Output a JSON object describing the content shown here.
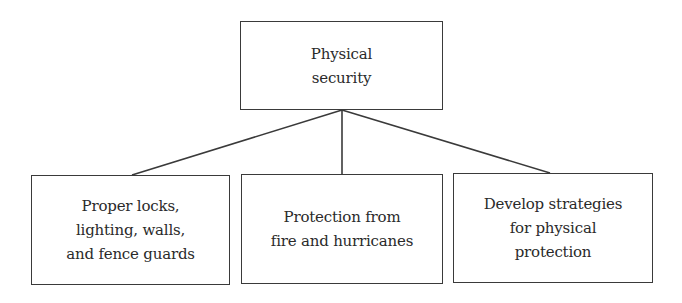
{
  "diagram": {
    "type": "hierarchy",
    "root": {
      "label": "Physical\nsecurity"
    },
    "children": [
      {
        "label": "Proper locks,\nlighting, walls,\nand fence guards"
      },
      {
        "label": "Protection from\nfire and hurricanes"
      },
      {
        "label": "Develop strategies\nfor physical\nprotection"
      }
    ],
    "edges": [
      {
        "from": "root",
        "to": "children.0"
      },
      {
        "from": "root",
        "to": "children.1"
      },
      {
        "from": "root",
        "to": "children.2"
      }
    ],
    "colors": {
      "stroke": "#3a3a3a",
      "text": "#2a2a2a",
      "background": "#ffffff"
    }
  }
}
